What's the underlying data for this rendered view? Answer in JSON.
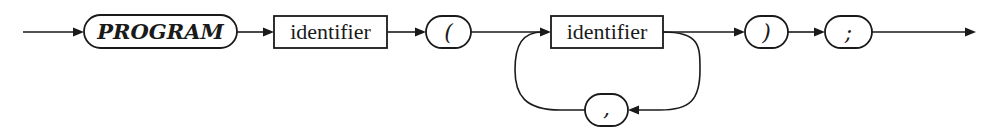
{
  "diagram": {
    "type": "syntax-diagram",
    "colors": {
      "stroke": "#1a1a1a",
      "background": "#ffffff"
    },
    "nodes": [
      {
        "id": "program_kw",
        "kind": "terminal",
        "label": "PROGRAM",
        "style": "bold-italic"
      },
      {
        "id": "identifier_1",
        "kind": "nonterminal",
        "label": "identifier"
      },
      {
        "id": "lparen",
        "kind": "terminal",
        "label": "("
      },
      {
        "id": "identifier_2",
        "kind": "nonterminal",
        "label": "identifier"
      },
      {
        "id": "comma",
        "kind": "terminal",
        "label": ","
      },
      {
        "id": "rparen",
        "kind": "terminal",
        "label": ")"
      },
      {
        "id": "semicolon",
        "kind": "terminal",
        "label": ";"
      }
    ],
    "edges": [
      {
        "from": "entry",
        "to": "program_kw"
      },
      {
        "from": "program_kw",
        "to": "identifier_1"
      },
      {
        "from": "identifier_1",
        "to": "lparen"
      },
      {
        "from": "lparen",
        "to": "identifier_2"
      },
      {
        "from": "identifier_2",
        "to": "rparen"
      },
      {
        "from": "identifier_2",
        "to": "comma",
        "note": "loop back"
      },
      {
        "from": "comma",
        "to": "identifier_2",
        "note": "loop back"
      },
      {
        "from": "rparen",
        "to": "semicolon"
      },
      {
        "from": "semicolon",
        "to": "exit"
      }
    ]
  }
}
